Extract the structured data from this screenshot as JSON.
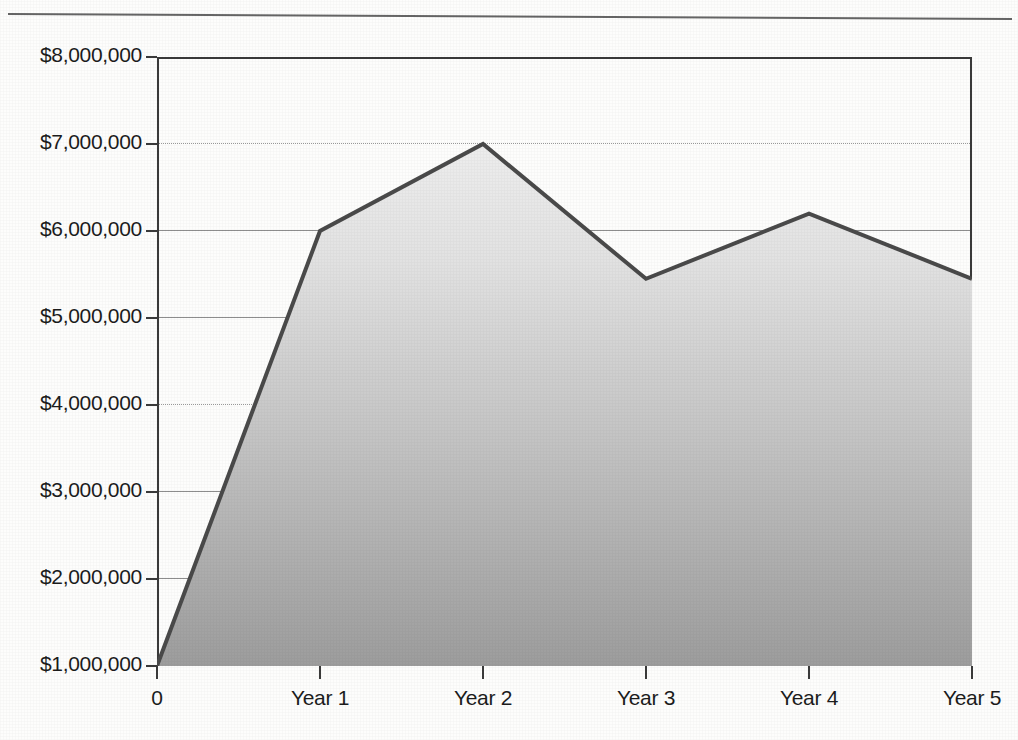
{
  "chart_data": {
    "type": "area",
    "title": "",
    "subtitle": "",
    "xlabel": "",
    "ylabel": "",
    "categories": [
      "0",
      "Year 1",
      "Year 2",
      "Year 3",
      "Year 4",
      "Year 5"
    ],
    "values": [
      1000000,
      6000000,
      7000000,
      5450000,
      6200000,
      5450000
    ],
    "series": [
      {
        "name": "",
        "values": [
          1000000,
          6000000,
          7000000,
          5450000,
          6200000,
          5450000
        ]
      }
    ],
    "ylim": [
      1000000,
      8000000
    ],
    "xlim": [
      0,
      5
    ],
    "y_ticks": [
      1000000,
      2000000,
      3000000,
      4000000,
      5000000,
      6000000,
      7000000,
      8000000
    ],
    "y_tick_labels": [
      "$1,000,000",
      "$2,000,000",
      "$3,000,000",
      "$4,000,000",
      "$5,000,000",
      "$6,000,000",
      "$7,000,000",
      "$8,000,000"
    ],
    "x_tick_labels": [
      "0",
      "Year 1",
      "Year 2",
      "Year 3",
      "Year 4",
      "Year 5"
    ],
    "grid": true,
    "grid_axis": "y",
    "legend": false,
    "legend_position": "none",
    "annotations": [],
    "colors": {
      "line": "#4a4a4a",
      "fill_top": "#ebebeb",
      "fill_bottom": "#a0a0a0",
      "axis": "#3a3a3a",
      "grid": "#8d8d8d",
      "text": "#1c1c1c",
      "background": "#fdfdfc"
    }
  },
  "axes": {
    "y_labels": [
      {
        "text": "$8,000,000",
        "value": 8000000
      },
      {
        "text": "$7,000,000",
        "value": 7000000
      },
      {
        "text": "$6,000,000",
        "value": 6000000
      },
      {
        "text": "$5,000,000",
        "value": 5000000
      },
      {
        "text": "$4,000,000",
        "value": 4000000
      },
      {
        "text": "$3,000,000",
        "value": 3000000
      },
      {
        "text": "$2,000,000",
        "value": 2000000
      },
      {
        "text": "$1,000,000",
        "value": 1000000
      }
    ],
    "x_labels": [
      {
        "text": "0",
        "index": 0
      },
      {
        "text": "Year 1",
        "index": 1
      },
      {
        "text": "Year 2",
        "index": 2
      },
      {
        "text": "Year 3",
        "index": 3
      },
      {
        "text": "Year 4",
        "index": 4
      },
      {
        "text": "Year 5",
        "index": 5
      }
    ]
  }
}
